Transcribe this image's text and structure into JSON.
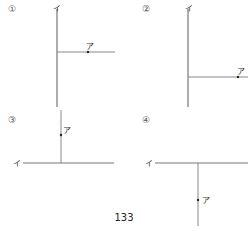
{
  "figures": [
    {
      "id": "1",
      "number_label": "①",
      "point_label": "ア",
      "line_label": "イ"
    },
    {
      "id": "2",
      "number_label": "②",
      "point_label": "ア",
      "line_label": "イ"
    },
    {
      "id": "3",
      "number_label": "③",
      "point_label": "ア",
      "line_label": "イ"
    },
    {
      "id": "4",
      "number_label": "④",
      "point_label": "ア",
      "line_label": "イ"
    }
  ],
  "page_number": "133",
  "colors": {
    "line": "#777777",
    "dot": "#222222"
  }
}
